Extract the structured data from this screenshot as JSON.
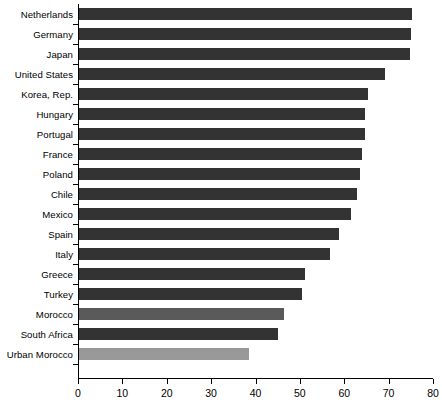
{
  "chart_data": {
    "type": "bar",
    "orientation": "horizontal",
    "title": "",
    "xlabel": "",
    "ylabel": "",
    "xlim": [
      0,
      80
    ],
    "xticks": [
      0,
      10,
      20,
      30,
      40,
      50,
      60,
      70,
      80
    ],
    "grid": false,
    "legend": "none",
    "categories": [
      "Netherlands",
      "Germany",
      "Japan",
      "United States",
      "Korea, Rep.",
      "Hungary",
      "Portugal",
      "France",
      "Poland",
      "Chile",
      "Mexico",
      "Spain",
      "Italy",
      "Greece",
      "Turkey",
      "Morocco",
      "South Africa",
      "Urban Morocco"
    ],
    "values": [
      75.0,
      74.8,
      74.5,
      69.0,
      65.2,
      64.4,
      64.4,
      63.8,
      63.4,
      62.6,
      61.3,
      58.6,
      56.5,
      50.9,
      50.3,
      46.2,
      44.8,
      38.3
    ],
    "bar_colors": [
      "#333333",
      "#333333",
      "#333333",
      "#333333",
      "#333333",
      "#333333",
      "#333333",
      "#333333",
      "#333333",
      "#333333",
      "#333333",
      "#333333",
      "#333333",
      "#333333",
      "#333333",
      "#5a5a5a",
      "#333333",
      "#999999"
    ],
    "colors": {
      "bar_dark": "#333333",
      "bar_medium": "#5a5a5a",
      "bar_light": "#999999",
      "axis": "#000000",
      "text": "#000000",
      "background": "#ffffff"
    }
  }
}
